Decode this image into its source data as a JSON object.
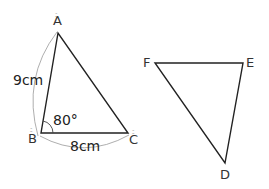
{
  "diagram": {
    "triangle_abc": {
      "vertices": {
        "A": {
          "label": "A"
        },
        "B": {
          "label": "B"
        },
        "C": {
          "label": "C"
        }
      },
      "side_ab": "9cm",
      "side_bc": "8cm",
      "angle_b": "80°"
    },
    "triangle_def": {
      "vertices": {
        "D": {
          "label": "D"
        },
        "E": {
          "label": "E"
        },
        "F": {
          "label": "F"
        }
      }
    },
    "colors": {
      "stroke": "#222222",
      "arc": "#888888",
      "text": "#333333"
    }
  }
}
